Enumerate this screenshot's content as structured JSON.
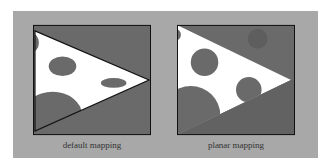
{
  "figure": {
    "panels": [
      {
        "id": "default",
        "caption": "default mapping"
      },
      {
        "id": "planar",
        "caption": "planar mapping"
      }
    ],
    "colors": {
      "background": "#a8a8a8",
      "box_fill": "#6a6a6a",
      "triangle_fill": "#ffffff",
      "spot_fill": "#6a6a6a",
      "border": "#111111"
    }
  }
}
